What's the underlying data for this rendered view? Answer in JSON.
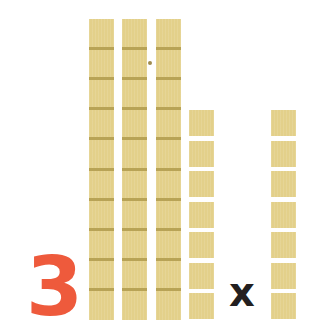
{
  "diagram": {
    "multiplier_label": "3",
    "operator_label": "x",
    "colors": {
      "block_fill": "#e3d08a",
      "block_divider": "#b8a356",
      "numeral": "#ee5a3c",
      "operator": "#231f20",
      "background": "#ffffff"
    },
    "tens_rods": {
      "count": 3,
      "units_per_rod": 10
    },
    "unit_groups": [
      {
        "name": "units-group-left",
        "count": 7
      },
      {
        "name": "units-group-right",
        "count": 7
      }
    ]
  }
}
